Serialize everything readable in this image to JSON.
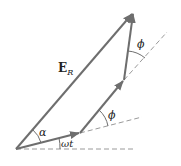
{
  "diagram": {
    "colors": {
      "vector": "#6e6e6e",
      "dashed": "#9a9a9a",
      "text": "#222222",
      "background": "#ffffff"
    },
    "labels": {
      "resultant": "E",
      "resultant_sub": "R",
      "alpha": "α",
      "omega_t": "ωt",
      "phi_mid": "ϕ",
      "phi_top": "ϕ"
    },
    "points": {
      "origin": [
        16,
        149
      ],
      "p1": [
        80,
        133
      ],
      "p2": [
        124,
        80
      ],
      "p3": [
        133,
        12
      ]
    },
    "vectors": [
      {
        "name": "phasor-1",
        "from": "origin",
        "to": "p1"
      },
      {
        "name": "phasor-2",
        "from": "p1",
        "to": "p2"
      },
      {
        "name": "phasor-3",
        "from": "p2",
        "to": "p3"
      },
      {
        "name": "resultant-ER",
        "from": "origin",
        "to": "p3"
      }
    ],
    "reference_lines": [
      {
        "name": "horizontal-axis",
        "from": [
          16,
          149
        ],
        "to": [
          135,
          149
        ]
      },
      {
        "name": "extension-1",
        "from": [
          80,
          133
        ],
        "to": [
          142,
          117
        ]
      },
      {
        "name": "extension-2",
        "from": [
          124,
          80
        ],
        "to": [
          167,
          32
        ]
      }
    ]
  }
}
